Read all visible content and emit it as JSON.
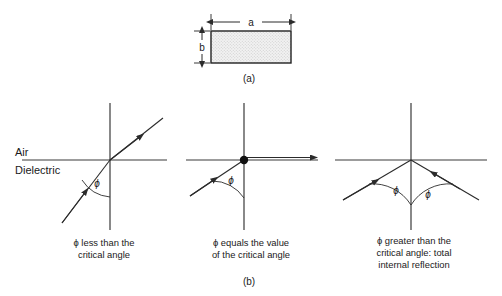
{
  "figure": {
    "panel_a": {
      "label": "(a)",
      "width_dim_label": "a",
      "height_dim_label": "b",
      "shape": "rectangle",
      "fill": "stippled",
      "fill_color": "#e9e9e9",
      "stroke_color": "#222222"
    },
    "panel_b": {
      "label": "(b)",
      "media": {
        "upper": "Air",
        "lower": "Dielectric"
      },
      "angle_symbol": "ϕ",
      "diagrams": [
        {
          "name": "less-than-critical",
          "angle_symbol": "ϕ",
          "caption_lines": [
            "ϕ less than the",
            "critical angle"
          ]
        },
        {
          "name": "equals-critical",
          "angle_symbol": "ϕ",
          "caption_lines": [
            "ϕ equals the value",
            "of the critical angle"
          ]
        },
        {
          "name": "greater-than-critical",
          "angle_symbol_left": "ϕ",
          "angle_symbol_right": "ϕ",
          "caption_lines": [
            "ϕ greater than the",
            "critical angle:  total",
            "internal reflection"
          ]
        }
      ]
    }
  },
  "colors": {
    "line": "#3a3a3a",
    "ray": "#2b2b2b",
    "text": "#1a1a1a",
    "rect_stroke": "#222222",
    "rect_fill": "#ececec"
  }
}
